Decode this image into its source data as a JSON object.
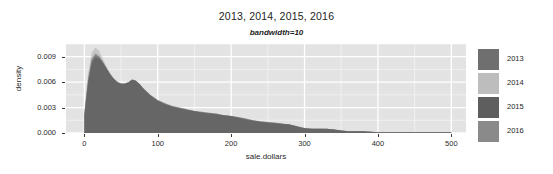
{
  "chart_data": {
    "type": "area",
    "title": "2013, 2014, 2015, 2016",
    "subtitle": "bandwidth=10",
    "xlabel": "sale.dollars",
    "ylabel": "density",
    "xlim": [
      -25,
      520
    ],
    "ylim": [
      0,
      0.0105
    ],
    "grid": true,
    "legend_position": "right",
    "x_ticks": [
      "0",
      "100",
      "200",
      "300",
      "400",
      "500"
    ],
    "x_tick_values": [
      0,
      100,
      200,
      300,
      400,
      500
    ],
    "y_ticks": [
      "0.000",
      "0.003",
      "0.006",
      "0.009"
    ],
    "y_tick_values": [
      0.0,
      0.003,
      0.006,
      0.009
    ],
    "series": [
      {
        "name": "2013",
        "color": "#6f6f6f",
        "x": [
          0,
          5,
          10,
          15,
          20,
          25,
          30,
          35,
          40,
          45,
          50,
          55,
          60,
          65,
          70,
          75,
          80,
          90,
          100,
          110,
          120,
          130,
          140,
          150,
          160,
          170,
          180,
          190,
          200,
          210,
          220,
          230,
          240,
          250,
          260,
          270,
          280,
          290,
          300,
          310,
          320,
          330,
          340,
          350,
          360,
          380,
          400,
          420,
          440,
          460,
          480,
          500
        ],
        "values": [
          0.0022,
          0.0062,
          0.0086,
          0.0092,
          0.009,
          0.0084,
          0.0077,
          0.007,
          0.0064,
          0.006,
          0.0058,
          0.0058,
          0.006,
          0.0063,
          0.0062,
          0.0058,
          0.0053,
          0.0044,
          0.0038,
          0.0034,
          0.0031,
          0.0029,
          0.0027,
          0.0026,
          0.0024,
          0.0023,
          0.0022,
          0.0021,
          0.002,
          0.0018,
          0.0016,
          0.0014,
          0.0013,
          0.0012,
          0.0011,
          0.0011,
          0.001,
          0.0007,
          0.0005,
          0.0005,
          0.0005,
          0.0005,
          0.0004,
          0.0003,
          0.0002,
          0.0002,
          0.0001,
          0.0001,
          0.0001,
          0.0001,
          0.0001,
          0.0001
        ]
      },
      {
        "name": "2014",
        "color": "#bdbdbd",
        "x": [
          0,
          5,
          10,
          15,
          20,
          25,
          30,
          35,
          40,
          45,
          50,
          55,
          60,
          65,
          70,
          75,
          80,
          90,
          100,
          110,
          120,
          130,
          140,
          150,
          160,
          170,
          180,
          190,
          200,
          210,
          220,
          230,
          240,
          250,
          260,
          270,
          280,
          290,
          300,
          310,
          320,
          330,
          340,
          350,
          360,
          380,
          400,
          420,
          440,
          460,
          480,
          500
        ],
        "values": [
          0.0025,
          0.007,
          0.0095,
          0.0101,
          0.0097,
          0.0088,
          0.0079,
          0.0071,
          0.0065,
          0.0061,
          0.0059,
          0.0059,
          0.006,
          0.0062,
          0.0061,
          0.0057,
          0.0052,
          0.0043,
          0.0037,
          0.0033,
          0.003,
          0.0028,
          0.0026,
          0.0025,
          0.0024,
          0.0022,
          0.0021,
          0.002,
          0.0019,
          0.0017,
          0.0016,
          0.0014,
          0.0013,
          0.0012,
          0.0011,
          0.001,
          0.0009,
          0.0007,
          0.0005,
          0.0005,
          0.0005,
          0.0004,
          0.0004,
          0.0003,
          0.0002,
          0.0002,
          0.0001,
          0.0001,
          0.0001,
          0.0001,
          0.0001,
          0.0001
        ]
      },
      {
        "name": "2015",
        "color": "#5e5e5e",
        "x": [
          0,
          5,
          10,
          15,
          20,
          25,
          30,
          35,
          40,
          45,
          50,
          55,
          60,
          65,
          70,
          75,
          80,
          90,
          100,
          110,
          120,
          130,
          140,
          150,
          160,
          170,
          180,
          190,
          200,
          210,
          220,
          230,
          240,
          250,
          260,
          270,
          280,
          290,
          300,
          310,
          320,
          330,
          340,
          350,
          360,
          380,
          400,
          420,
          440,
          460,
          480,
          500
        ],
        "values": [
          0.0021,
          0.0059,
          0.0082,
          0.0089,
          0.0088,
          0.0083,
          0.0076,
          0.0069,
          0.0064,
          0.006,
          0.0058,
          0.0058,
          0.006,
          0.0063,
          0.0062,
          0.0058,
          0.0053,
          0.0045,
          0.0039,
          0.0035,
          0.0032,
          0.003,
          0.0028,
          0.0026,
          0.0025,
          0.0024,
          0.0023,
          0.0021,
          0.002,
          0.0019,
          0.0017,
          0.0015,
          0.0014,
          0.0013,
          0.0012,
          0.0011,
          0.001,
          0.0008,
          0.0006,
          0.0005,
          0.0005,
          0.0005,
          0.0004,
          0.0003,
          0.0002,
          0.0002,
          0.0001,
          0.0001,
          0.0001,
          0.0001,
          0.0001,
          0.0001
        ]
      },
      {
        "name": "2016",
        "color": "#8a8a8a",
        "x": [
          0,
          5,
          10,
          15,
          20,
          25,
          30,
          35,
          40,
          45,
          50,
          55,
          60,
          65,
          70,
          75,
          80,
          90,
          100,
          110,
          120,
          130,
          140,
          150,
          160,
          170,
          180,
          190,
          200,
          210,
          220,
          230,
          240,
          250,
          260,
          270,
          280,
          290,
          300,
          310,
          320,
          330,
          340,
          350,
          360,
          380,
          400,
          420,
          440,
          460,
          480,
          500
        ],
        "values": [
          0.0023,
          0.0064,
          0.0088,
          0.0094,
          0.0091,
          0.0085,
          0.0077,
          0.007,
          0.0064,
          0.006,
          0.0058,
          0.0058,
          0.0059,
          0.0062,
          0.0061,
          0.0057,
          0.0052,
          0.0044,
          0.0038,
          0.0034,
          0.0031,
          0.0029,
          0.0027,
          0.0026,
          0.0024,
          0.0023,
          0.0022,
          0.0021,
          0.002,
          0.0018,
          0.0016,
          0.0015,
          0.0013,
          0.0012,
          0.0012,
          0.0011,
          0.001,
          0.0008,
          0.0006,
          0.0005,
          0.0005,
          0.0005,
          0.0004,
          0.0003,
          0.0002,
          0.0002,
          0.0001,
          0.0001,
          0.0001,
          0.0001,
          0.0001,
          0.0001
        ]
      }
    ]
  },
  "legend": {
    "items": [
      {
        "label": "2013",
        "color": "#6f6f6f"
      },
      {
        "label": "2014",
        "color": "#bdbdbd"
      },
      {
        "label": "2015",
        "color": "#5e5e5e"
      },
      {
        "label": "2016",
        "color": "#8a8a8a"
      }
    ]
  },
  "style": {
    "panel_background": "#e3e3e3",
    "gridline_color": "#ffffff",
    "text_color": "#1d1d1d"
  }
}
